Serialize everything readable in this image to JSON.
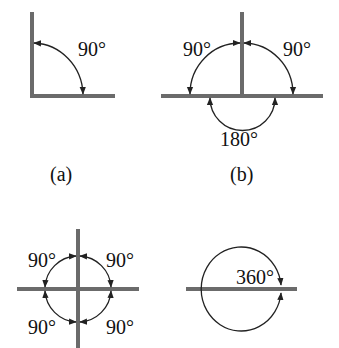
{
  "figure": {
    "panels": [
      {
        "id": "a",
        "caption": "(a)",
        "angles": [
          "90°"
        ]
      },
      {
        "id": "b",
        "caption": "(b)",
        "angles": [
          "90°",
          "90°",
          "180°"
        ]
      },
      {
        "id": "c",
        "caption": "",
        "angles": [
          "90°",
          "90°",
          "90°",
          "90°"
        ]
      },
      {
        "id": "d",
        "caption": "",
        "angles": [
          "360°"
        ]
      }
    ]
  },
  "colors": {
    "line": "#6b6b6b",
    "arc": "#222222",
    "text": "#111111"
  }
}
